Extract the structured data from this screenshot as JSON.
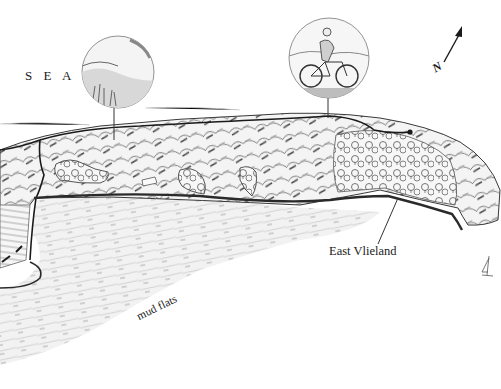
{
  "map": {
    "style": "hand-drawn pencil illustration",
    "labels": {
      "sea": "S E A",
      "east_vlieland": "East Vlieland",
      "mud_flats": "mud flats",
      "north": "N"
    },
    "vignettes": [
      {
        "id": "dunes-vignette",
        "subject": "dune landscape with grasses"
      },
      {
        "id": "cyclist-vignette",
        "subject": "cyclist on bicycle"
      }
    ],
    "features": {
      "compass": "north-arrow",
      "boat": "sailboat",
      "route": "dark route line along island",
      "island": "Vlieland"
    },
    "colors": {
      "ink": "#1a1a1a",
      "pencil": "#8a8a8a",
      "shade": "#c8c8c8",
      "paper": "#ffffff"
    }
  }
}
